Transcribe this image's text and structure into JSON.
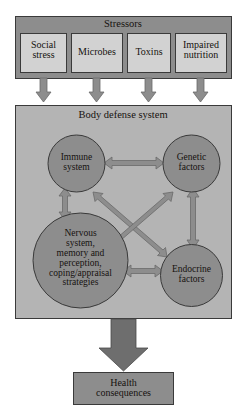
{
  "diagram": {
    "title": "Stressors",
    "stressors_panel": {
      "label": "Stressors",
      "items": [
        {
          "label": "Social\nstress"
        },
        {
          "label": "Microbes"
        },
        {
          "label": "Toxins"
        },
        {
          "label": "Impaired\nnutrition"
        }
      ]
    },
    "body_defense_panel": {
      "label": "Body defense system",
      "nodes": [
        {
          "id": "immune",
          "label": "Immune\nsystem"
        },
        {
          "id": "genetic",
          "label": "Genetic\nfactors"
        },
        {
          "id": "nervous",
          "label": "Nervous\nsystem,\nmemory and\nperception,\ncoping/appraisal\nstrategies"
        },
        {
          "id": "endocrine",
          "label": "Endocrine\nfactors"
        }
      ],
      "connections": [
        {
          "from": "immune",
          "to": "genetic",
          "type": "double"
        },
        {
          "from": "immune",
          "to": "nervous",
          "type": "double"
        },
        {
          "from": "genetic",
          "to": "endocrine",
          "type": "double"
        },
        {
          "from": "nervous",
          "to": "endocrine",
          "type": "double"
        },
        {
          "from": "immune",
          "to": "endocrine",
          "type": "double"
        },
        {
          "from": "genetic",
          "to": "nervous",
          "type": "double"
        }
      ]
    },
    "outcome": {
      "label": "Health\nconsequences"
    },
    "colors": {
      "stressors_panel_fill": "#8d8d8d",
      "stressors_panel_border": "#3a3a3a",
      "stressor_box_fill": "#d2d2d2",
      "stressor_box_border": "#3a3a3a",
      "body_panel_fill": "#b4b4b4",
      "body_panel_border": "#3a3a3a",
      "node_fill": "#8d8d8d",
      "node_border": "#3a3a3a",
      "arrow_fill": "#8d8d8d",
      "arrow_border": "#6a6a6a",
      "big_arrow_fill": "#6e6e6e",
      "outcome_fill": "#8d8d8d",
      "outcome_border": "#3a3a3a",
      "text": "#16120f",
      "page_background": "#ffffff"
    }
  }
}
